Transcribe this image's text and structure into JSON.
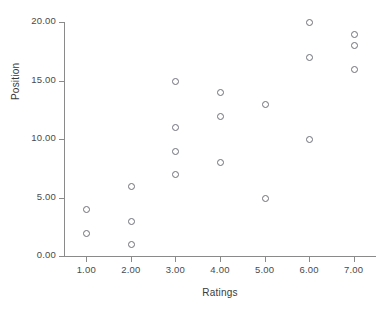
{
  "chart_data": {
    "type": "scatter",
    "title": "",
    "xlabel": "Ratings",
    "ylabel": "Position",
    "xlim": [
      0.5,
      7.5
    ],
    "ylim": [
      0,
      20
    ],
    "grid": false,
    "legend": null,
    "x_ticks": [
      "1.00",
      "2.00",
      "3.00",
      "4.00",
      "5.00",
      "6.00",
      "7.00"
    ],
    "x_tick_values": [
      1,
      2,
      3,
      4,
      5,
      6,
      7
    ],
    "y_ticks": [
      "0.00",
      "5.00",
      "10.00",
      "15.00",
      "20.00"
    ],
    "y_tick_values": [
      0,
      5,
      10,
      15,
      20
    ],
    "marker": "open-circle",
    "marker_color": "#6f6f7a",
    "points": [
      {
        "x": 1,
        "y": 4
      },
      {
        "x": 1,
        "y": 2
      },
      {
        "x": 2,
        "y": 6
      },
      {
        "x": 2,
        "y": 3
      },
      {
        "x": 2,
        "y": 1
      },
      {
        "x": 3,
        "y": 15
      },
      {
        "x": 3,
        "y": 11
      },
      {
        "x": 3,
        "y": 9
      },
      {
        "x": 3,
        "y": 7
      },
      {
        "x": 4,
        "y": 14
      },
      {
        "x": 4,
        "y": 12
      },
      {
        "x": 4,
        "y": 8
      },
      {
        "x": 5,
        "y": 13
      },
      {
        "x": 5,
        "y": 5
      },
      {
        "x": 6,
        "y": 20
      },
      {
        "x": 6,
        "y": 17
      },
      {
        "x": 6,
        "y": 10
      },
      {
        "x": 7,
        "y": 19
      },
      {
        "x": 7,
        "y": 18
      },
      {
        "x": 7,
        "y": 16
      }
    ]
  }
}
